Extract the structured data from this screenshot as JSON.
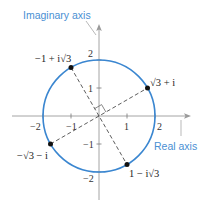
{
  "diagram": {
    "type": "complex-plane",
    "colors": {
      "circle": "#3a86d0",
      "label": "#4a8fd3",
      "axis": "#9a9a9a",
      "point": "#111111"
    },
    "axes": {
      "imaginary_label": "Imaginary axis",
      "real_label": "Real axis",
      "x_ticks": [
        {
          "value": -2,
          "label": "−2"
        },
        {
          "value": -1,
          "label": "−1"
        },
        {
          "value": 1,
          "label": "1"
        },
        {
          "value": 2,
          "label": "2"
        }
      ],
      "y_ticks": [
        {
          "value": 2,
          "label": "2"
        },
        {
          "value": 1,
          "label": "1"
        },
        {
          "value": -1,
          "label": "−1"
        },
        {
          "value": -2,
          "label": "−2"
        }
      ]
    },
    "circle": {
      "center": [
        0,
        0
      ],
      "radius": 2
    },
    "points": [
      {
        "name": "sqrt3-plus-i",
        "label": "√3 + i",
        "re": 1.732,
        "im": 1
      },
      {
        "name": "neg1-plus-i-sqrt3",
        "label": "−1 + i√3",
        "re": -1,
        "im": 1.732
      },
      {
        "name": "neg-sqrt3-minus-i",
        "label": "−√3 − i",
        "re": -1.732,
        "im": -1
      },
      {
        "name": "1-minus-i-sqrt3",
        "label": "1 − i√3",
        "re": 1,
        "im": -1.732
      }
    ],
    "right_angle_marker": true
  }
}
